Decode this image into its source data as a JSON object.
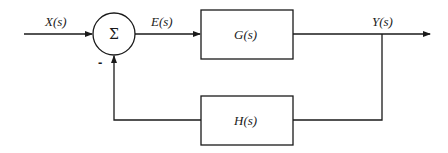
{
  "diagram": {
    "type": "negative feedback control block diagram",
    "colors": {
      "stroke": "#1a1a1a",
      "background": "#ffffff"
    },
    "summing_junction": {
      "symbol": "Σ",
      "feedback_sign": "-"
    },
    "signals": {
      "input": "X(s)",
      "error": "E(s)",
      "output": "Y(s)"
    },
    "blocks": {
      "forward": "G(s)",
      "feedback": "H(s)"
    }
  }
}
